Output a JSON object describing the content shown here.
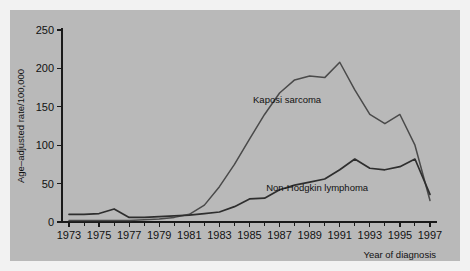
{
  "figure": {
    "background_color": "#b9b9b9",
    "outer_color": "#f2f2f2",
    "line_color": "#4a4a4a",
    "axis_color": "#1a1a1a"
  },
  "axes": {
    "ylabel": "Age–adjusted rate/100,000",
    "xlabel": "Year of diagnosis",
    "y_ticks": [
      "0",
      "50",
      "100",
      "150",
      "200",
      "250"
    ],
    "x_ticks": [
      "1973",
      "1975",
      "1977",
      "1979",
      "1981",
      "1983",
      "1985",
      "1987",
      "1989",
      "1991",
      "1993",
      "1995",
      "1997"
    ]
  },
  "labels": {
    "kaposi": "Kaposi sarcoma",
    "nhl": "Non-Hodgkin lymphoma"
  },
  "chart_data": {
    "type": "line",
    "title": "",
    "xlabel": "Year of diagnosis",
    "ylabel": "Age–adjusted rate/100,000",
    "xlim": [
      1973,
      1997
    ],
    "ylim": [
      0,
      250
    ],
    "grid": false,
    "legend": "inline-annotation",
    "x": [
      1973,
      1974,
      1975,
      1976,
      1977,
      1978,
      1979,
      1980,
      1981,
      1982,
      1983,
      1984,
      1985,
      1986,
      1987,
      1988,
      1989,
      1990,
      1991,
      1992,
      1993,
      1994,
      1995,
      1996,
      1997
    ],
    "series": [
      {
        "name": "Kaposi sarcoma",
        "values": [
          2,
          2,
          2,
          2,
          2,
          3,
          4,
          6,
          10,
          22,
          46,
          75,
          108,
          140,
          168,
          185,
          190,
          188,
          208,
          172,
          140,
          128,
          140,
          100,
          28
        ],
        "label_x": 1987.5,
        "label_y": 155
      },
      {
        "name": "Non-Hodgkin lymphoma",
        "values": [
          10,
          10,
          11,
          17,
          6,
          6,
          7,
          8,
          9,
          11,
          13,
          20,
          30,
          31,
          42,
          48,
          52,
          56,
          68,
          82,
          70,
          68,
          72,
          82,
          36
        ],
        "label_x": 1989.5,
        "label_y": 40
      }
    ]
  }
}
